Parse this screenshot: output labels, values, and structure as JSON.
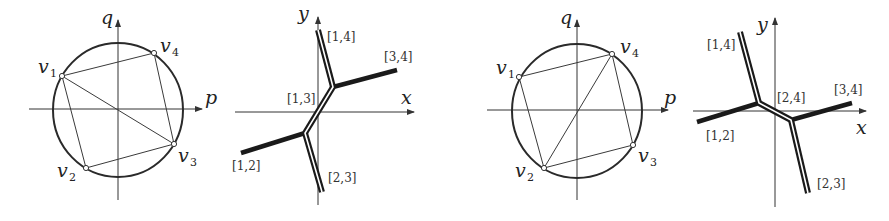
{
  "figure": {
    "panels": [
      {
        "id": "dual-subdivision-a",
        "axes": {
          "x_label": "p",
          "y_label": "q"
        },
        "vertices": [
          {
            "name": "v",
            "sub": "1"
          },
          {
            "name": "v",
            "sub": "2"
          },
          {
            "name": "v",
            "sub": "3"
          },
          {
            "name": "v",
            "sub": "4"
          }
        ],
        "diagonal": "v1-v3"
      },
      {
        "id": "tropical-curve-a",
        "axes": {
          "x_label": "x",
          "y_label": "y"
        },
        "edge_labels": [
          "[1,4]",
          "[3,4]",
          "[1,3]",
          "[1,2]",
          "[2,3]"
        ]
      },
      {
        "id": "dual-subdivision-b",
        "axes": {
          "x_label": "p",
          "y_label": "q"
        },
        "vertices": [
          {
            "name": "v",
            "sub": "1"
          },
          {
            "name": "v",
            "sub": "2"
          },
          {
            "name": "v",
            "sub": "3"
          },
          {
            "name": "v",
            "sub": "4"
          }
        ],
        "diagonal": "v2-v4"
      },
      {
        "id": "tropical-curve-b",
        "axes": {
          "x_label": "x",
          "y_label": "y"
        },
        "edge_labels": [
          "[1,4]",
          "[3,4]",
          "[2,4]",
          "[1,2]",
          "[2,3]"
        ]
      }
    ]
  },
  "colors": {
    "ink": "#1a1a1a",
    "background": "#ffffff"
  }
}
